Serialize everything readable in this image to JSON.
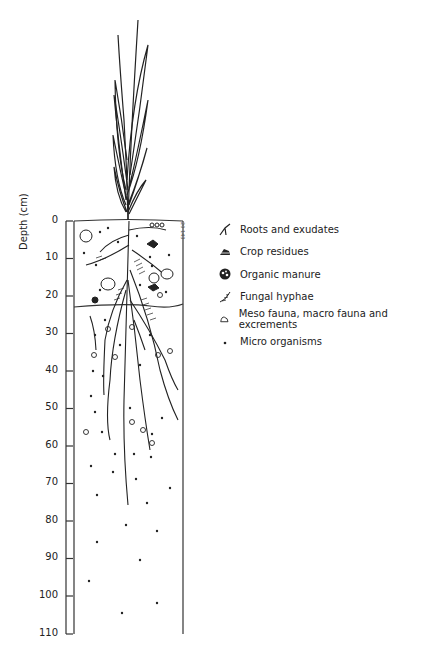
{
  "figure": {
    "type": "soil profile diagram",
    "figure_id": "20 143",
    "y_axis": {
      "label": "Depth (cm)",
      "ticks": [
        "0",
        "10",
        "20",
        "30",
        "40",
        "50",
        "60",
        "70",
        "80",
        "90",
        "100",
        "110"
      ],
      "range": [
        0,
        110
      ]
    },
    "layers": [
      {
        "name": "topsoil",
        "from_cm": 0,
        "to_cm": 23
      },
      {
        "name": "subsoil",
        "from_cm": 23,
        "to_cm": 110
      }
    ]
  },
  "legend": {
    "items": [
      {
        "icon": "roots-icon",
        "label": "Roots and exudates"
      },
      {
        "icon": "crop-residue-icon",
        "label": "Crop residues"
      },
      {
        "icon": "organic-manure-icon",
        "label": "Organic manure"
      },
      {
        "icon": "fungal-hyphae-icon",
        "label": "Fungal hyphae"
      },
      {
        "icon": "fauna-icon",
        "label": "Meso fauna, macro fauna and excrements"
      },
      {
        "icon": "micro-organism-icon",
        "label": "Micro organisms"
      }
    ]
  },
  "colors": {
    "ink": "#222222",
    "background": "#ffffff"
  }
}
